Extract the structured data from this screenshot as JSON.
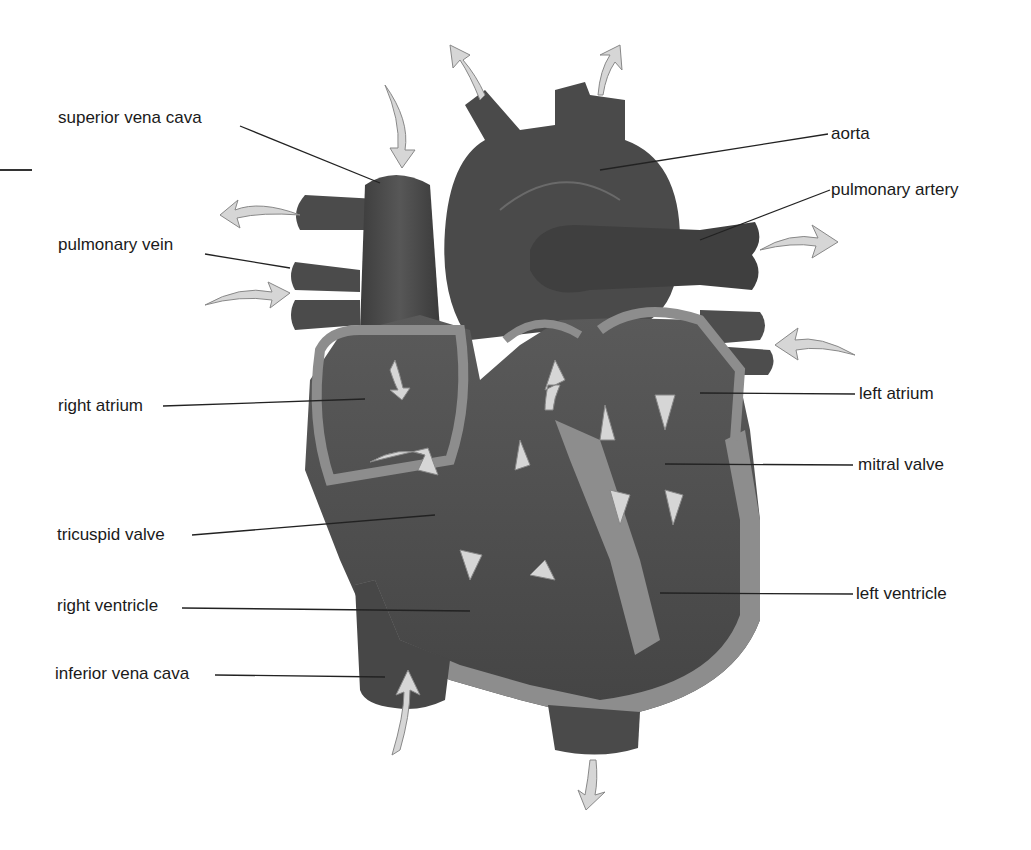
{
  "diagram": {
    "labels": {
      "superior_vena_cava": "superior vena cava",
      "pulmonary_vein": "pulmonary vein",
      "right_atrium": "right atrium",
      "tricuspid_valve": "tricuspid valve",
      "right_ventricle": "right ventricle",
      "inferior_vena_cava": "inferior vena cava",
      "aorta": "aorta",
      "pulmonary_artery": "pulmonary artery",
      "left_atrium": "left atrium",
      "mitral_valve": "mitral valve",
      "left_ventricle": "left ventricle"
    },
    "colors": {
      "vessel": "#4a4a4a",
      "chamber": "#555555",
      "wall": "#8f8f8f",
      "arrow": "#d6d6d6",
      "leader": "#222222"
    }
  }
}
